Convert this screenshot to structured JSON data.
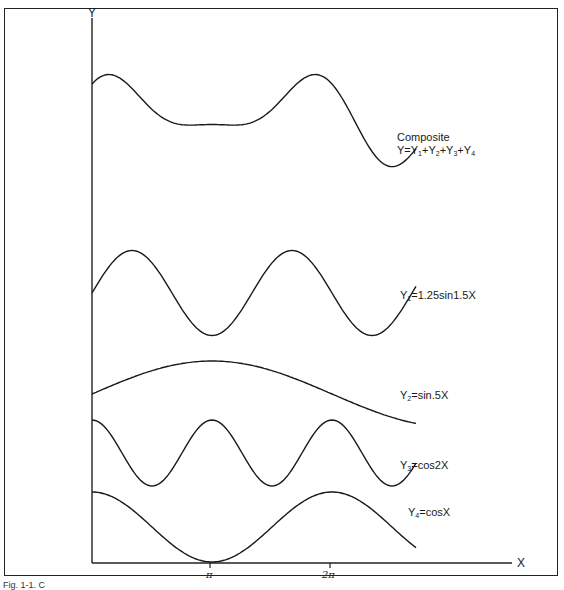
{
  "chart_data": {
    "type": "line",
    "title": "",
    "xlabel": "X",
    "ylabel": "Y",
    "x_ticks": [
      {
        "label": "π",
        "value": 3.1416
      },
      {
        "label": "2π",
        "value": 6.2832
      }
    ],
    "xlim": [
      0,
      8.5
    ],
    "grid": false,
    "legend_position": "right (inline labels)",
    "series": [
      {
        "name": "Composite",
        "formula": "Y=Y1+Y2+Y3+Y4",
        "function": "1.25sin(1.5x)+sin(0.5x)+cos(2x)+cos(x)",
        "offset_px": 120,
        "scale_px": 18
      },
      {
        "name": "Y1",
        "formula": "Y1=1.25sin1.5X",
        "function": "1.25*sin(1.5x)",
        "offset_px": 293,
        "scale_px": 34
      },
      {
        "name": "Y2",
        "formula": "Y2=sin.5X",
        "function": "sin(0.5x)",
        "offset_px": 394,
        "scale_px": 33
      },
      {
        "name": "Y3",
        "formula": "Y3=cos2X",
        "function": "cos(2x)",
        "offset_px": 453,
        "scale_px": 33
      },
      {
        "name": "Y4",
        "formula": "Y4=cosX",
        "function": "cos(x)",
        "offset_px": 527,
        "scale_px": 35
      }
    ]
  },
  "axes": {
    "y_label": "Y",
    "x_label": "X",
    "tick_pi": "π",
    "tick_2pi": "2π"
  },
  "labels": {
    "composite_title": "Composite",
    "composite_formula": {
      "base": "Y=Y",
      "s1": "1",
      "p1": "+Y",
      "s2": "2",
      "p2": "+Y",
      "s3": "3",
      "p3": "+Y",
      "s4": "4"
    },
    "y1": {
      "pre": "Y",
      "sub": "1",
      "post": "=1.25sin1.5X"
    },
    "y2": {
      "pre": "Y",
      "sub": "2",
      "post": "=sin.5X"
    },
    "y3": {
      "pre": "Y",
      "sub": "3",
      "post": "=cos2X"
    },
    "y4": {
      "pre": "Y",
      "sub": "4",
      "post": "=cosX"
    }
  },
  "caption": "Fig. 1-1. C"
}
